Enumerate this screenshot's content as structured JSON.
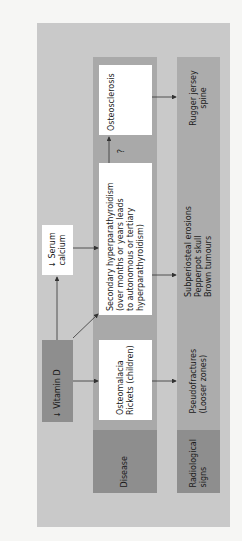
{
  "diagram": {
    "orientation": "rotated-90-ccw",
    "colors": {
      "page": "#f6f6f4",
      "outer_panel": "#c9c9c9",
      "column": "#a9a9a9",
      "header": "#8e8e8e",
      "box": "#ffffff",
      "arrow": "#333333"
    },
    "cause": {
      "vitamin_d": "↓ Vitamin D",
      "serum_calcium": [
        "↓ Serum",
        "calcium"
      ]
    },
    "rows": {
      "disease_label": "Disease",
      "radiological_label": [
        "Radiological",
        "signs"
      ]
    },
    "diseases": [
      {
        "name": [
          "Osteomalacia",
          "Rickets (children)"
        ]
      },
      {
        "name": [
          "Secondary hyperparathyroidism",
          "(over months or years leads",
          "to autonomous or tertiary",
          "hyperparathyroidism)"
        ]
      },
      {
        "name": [
          "Osteosclerosis"
        ]
      }
    ],
    "radiological_signs": [
      {
        "signs": [
          "Pseudofractures",
          "(Looser zones)"
        ]
      },
      {
        "signs": [
          "Subperiosteal erosions",
          "Pepperpot skull",
          "Brown tumours"
        ]
      },
      {
        "signs": [
          "Rugger jersey",
          "spine"
        ]
      }
    ],
    "uncertain_link_label": "?"
  }
}
